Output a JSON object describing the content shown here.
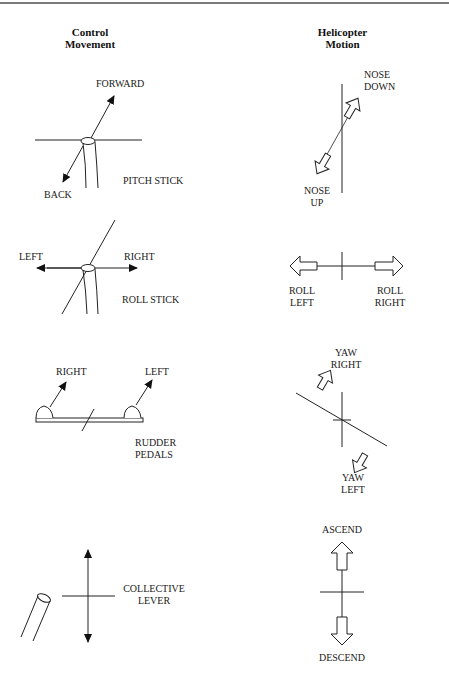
{
  "headers": {
    "left": [
      "Control",
      "Movement"
    ],
    "right": [
      "Helicopter",
      "Motion"
    ]
  },
  "rows": [
    {
      "control": {
        "name": "PITCH STICK",
        "directions": [
          "FORWARD",
          "BACK"
        ]
      },
      "motion": {
        "labels": [
          [
            "NOSE",
            "DOWN"
          ],
          [
            "NOSE",
            "UP"
          ]
        ]
      }
    },
    {
      "control": {
        "name": "ROLL STICK",
        "directions": [
          "LEFT",
          "RIGHT"
        ]
      },
      "motion": {
        "labels": [
          [
            "ROLL",
            "LEFT"
          ],
          [
            "ROLL",
            "RIGHT"
          ]
        ]
      }
    },
    {
      "control": {
        "name": [
          "RUDDER",
          "PEDALS"
        ],
        "directions": [
          "RIGHT",
          "LEFT"
        ]
      },
      "motion": {
        "labels": [
          [
            "YAW",
            "RIGHT"
          ],
          [
            "YAW",
            "LEFT"
          ]
        ]
      }
    },
    {
      "control": {
        "name": [
          "COLLECTIVE",
          "LEVER"
        ],
        "directions": []
      },
      "motion": {
        "labels": [
          [
            "ASCEND"
          ],
          [
            "DESCEND"
          ]
        ]
      }
    }
  ]
}
